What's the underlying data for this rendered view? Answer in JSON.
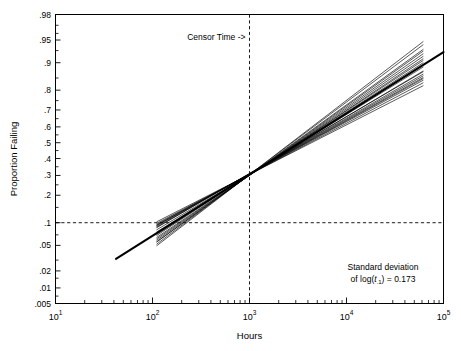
{
  "chart_data": {
    "type": "line",
    "title": "",
    "xlabel": "Hours",
    "ylabel": "Proportion Failing",
    "xscale": "log10",
    "yscale": "lognormal-probability",
    "xlim": [
      10,
      100000
    ],
    "ylim": [
      0.005,
      0.98
    ],
    "grid": false,
    "legend": null,
    "x_tick_labels": [
      "10¹",
      "10²",
      "10³",
      "10⁴",
      "10⁵"
    ],
    "x_tick_values": [
      10,
      100,
      1000,
      10000,
      100000
    ],
    "x_tick_bases": [
      "10",
      "10",
      "10",
      "10",
      "10"
    ],
    "x_tick_exps": [
      "1",
      "2",
      "3",
      "4",
      "5"
    ],
    "y_tick_labels": [
      ".98",
      ".95",
      ".9",
      ".8",
      ".7",
      ".6",
      ".5",
      ".4",
      ".3",
      ".2",
      ".1",
      ".05",
      ".02",
      ".01",
      ".005"
    ],
    "y_tick_values": [
      0.98,
      0.95,
      0.9,
      0.8,
      0.7,
      0.6,
      0.5,
      0.4,
      0.3,
      0.2,
      0.1,
      0.05,
      0.02,
      0.01,
      0.005
    ],
    "annotations": [
      {
        "name": "censor-time",
        "text": "Censor Time ->",
        "x": 1000,
        "y": 0.95
      },
      {
        "name": "standard-deviation-note",
        "line1": "Standard deviation",
        "line2_prefix": "of log(",
        "line2_var": "t",
        "line2_sub": ".1",
        "line2_suffix": ") = 0.173",
        "value": 0.173
      }
    ],
    "reference_line": {
      "name": "true-distribution-line",
      "mu_log10": 3.52,
      "sigma_log10": 1.02,
      "x_start": 42,
      "y_start": 0.0098,
      "x_end": 100000,
      "y_end": 0.9,
      "emphasis": "thick"
    },
    "simulated_lines_count": 20,
    "simulated_lines_note": "ML estimates from 20 simulated censored samples; all fits pass through a common pinch region near the censoring time at 1000 hours",
    "series": [
      {
        "name": "sim-1",
        "mu_log10": 3.5,
        "sigma_log10": 0.96
      },
      {
        "name": "sim-2",
        "mu_log10": 3.54,
        "sigma_log10": 1.1
      },
      {
        "name": "sim-3",
        "mu_log10": 3.47,
        "sigma_log10": 0.9
      },
      {
        "name": "sim-4",
        "mu_log10": 3.58,
        "sigma_log10": 1.16
      },
      {
        "name": "sim-5",
        "mu_log10": 3.51,
        "sigma_log10": 1.0
      },
      {
        "name": "sim-6",
        "mu_log10": 3.44,
        "sigma_log10": 0.86
      },
      {
        "name": "sim-7",
        "mu_log10": 3.62,
        "sigma_log10": 1.22
      },
      {
        "name": "sim-8",
        "mu_log10": 3.49,
        "sigma_log10": 0.94
      },
      {
        "name": "sim-9",
        "mu_log10": 3.56,
        "sigma_log10": 1.12
      },
      {
        "name": "sim-10",
        "mu_log10": 3.53,
        "sigma_log10": 1.04
      },
      {
        "name": "sim-11",
        "mu_log10": 3.46,
        "sigma_log10": 0.89
      },
      {
        "name": "sim-12",
        "mu_log10": 3.6,
        "sigma_log10": 1.19
      },
      {
        "name": "sim-13",
        "mu_log10": 3.52,
        "sigma_log10": 1.02
      },
      {
        "name": "sim-14",
        "mu_log10": 3.48,
        "sigma_log10": 0.92
      },
      {
        "name": "sim-15",
        "mu_log10": 3.57,
        "sigma_log10": 1.14
      },
      {
        "name": "sim-16",
        "mu_log10": 3.43,
        "sigma_log10": 0.84
      },
      {
        "name": "sim-17",
        "mu_log10": 3.64,
        "sigma_log10": 1.26
      },
      {
        "name": "sim-18",
        "mu_log10": 3.55,
        "sigma_log10": 1.08
      },
      {
        "name": "sim-19",
        "mu_log10": 3.5,
        "sigma_log10": 0.98
      },
      {
        "name": "sim-20",
        "mu_log10": 3.59,
        "sigma_log10": 1.17
      }
    ],
    "sim_x_start": 110,
    "sim_x_end": 62000,
    "censor_time": 1000,
    "reference_probability": 0.1,
    "colors": {
      "line": "#000000",
      "axis": "#000000",
      "background": "#ffffff"
    }
  }
}
